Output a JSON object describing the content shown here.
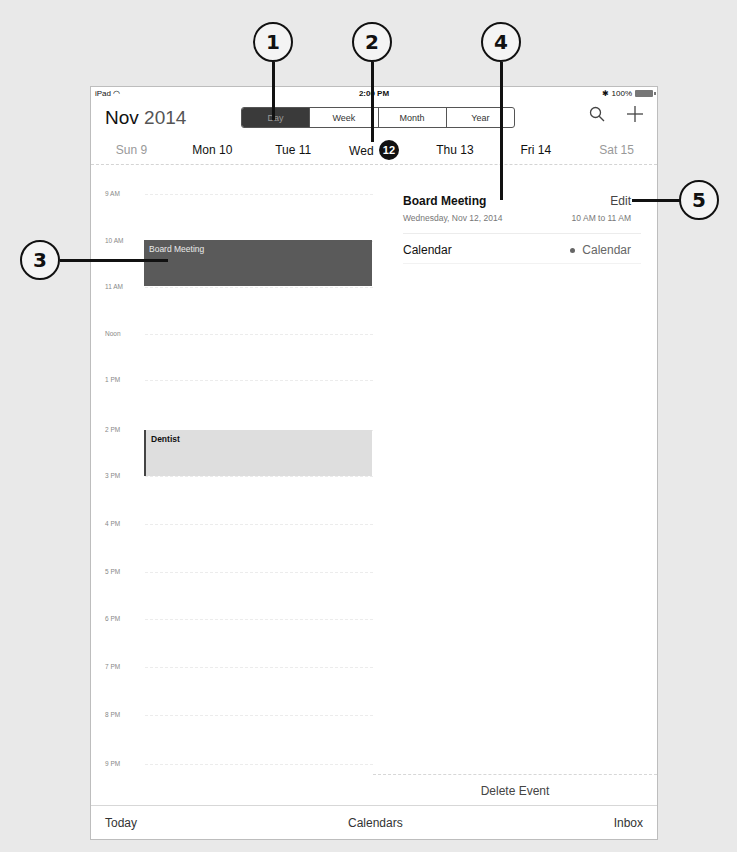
{
  "callouts": [
    {
      "label": "1"
    },
    {
      "label": "2"
    },
    {
      "label": "3"
    },
    {
      "label": "4"
    },
    {
      "label": "5"
    }
  ],
  "status_bar": {
    "device": "iPad",
    "wifi_icon": "wifi-icon",
    "time": "2:00 PM",
    "bluetooth_icon": "bluetooth-icon",
    "battery": "100%"
  },
  "header": {
    "month": "Nov",
    "year": "2014",
    "view_tabs": [
      {
        "label": "Day",
        "active": true
      },
      {
        "label": "Week",
        "active": false
      },
      {
        "label": "Month",
        "active": false
      },
      {
        "label": "Year",
        "active": false
      }
    ],
    "search_icon": "search-icon",
    "add_icon": "plus-icon"
  },
  "week": [
    {
      "dow": "Sun",
      "date": "9",
      "weekend": true,
      "selected": false
    },
    {
      "dow": "Mon",
      "date": "10",
      "weekend": false,
      "selected": false
    },
    {
      "dow": "Tue",
      "date": "11",
      "weekend": false,
      "selected": false
    },
    {
      "dow": "Wed",
      "date": "12",
      "weekend": false,
      "selected": true
    },
    {
      "dow": "Thu",
      "date": "13",
      "weekend": false,
      "selected": false
    },
    {
      "dow": "Fri",
      "date": "14",
      "weekend": false,
      "selected": false
    },
    {
      "dow": "Sat",
      "date": "15",
      "weekend": true,
      "selected": false
    }
  ],
  "timeline": {
    "hours": [
      "9 AM",
      "10 AM",
      "11 AM",
      "Noon",
      "1 PM",
      "2 PM",
      "3 PM",
      "4 PM",
      "5 PM",
      "6 PM",
      "7 PM",
      "8 PM",
      "9 PM"
    ],
    "events": [
      {
        "title": "Board Meeting",
        "start": "10 AM",
        "end": "11 AM",
        "color": "#5a5a5a"
      },
      {
        "title": "Dentist",
        "start": "2 PM",
        "end": "3 PM",
        "color": "#dedede"
      }
    ]
  },
  "detail": {
    "title": "Board Meeting",
    "edit_label": "Edit",
    "date": "Wednesday, Nov 12, 2014",
    "time": "10 AM to 11 AM",
    "calendar_label": "Calendar",
    "calendar_value": "Calendar",
    "delete_label": "Delete Event"
  },
  "bottom_bar": {
    "today": "Today",
    "calendars": "Calendars",
    "inbox": "Inbox"
  }
}
